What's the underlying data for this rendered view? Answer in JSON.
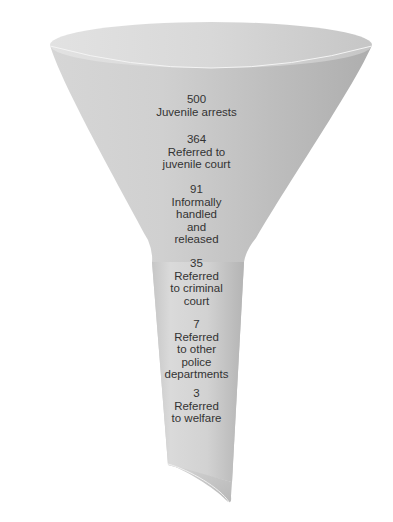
{
  "diagram": {
    "type": "funnel",
    "colors": {
      "background": "#ffffff",
      "funnel_light": "#d4d4d4",
      "funnel_dark": "#b0b0b0",
      "rim_interior": "#dcdcdc",
      "rim_highlight": "#f2f2f2",
      "opening_interior": "#c4c4c4",
      "text": "#333333"
    },
    "stages": [
      {
        "count": "500",
        "lines": [
          "Juvenile arrests"
        ]
      },
      {
        "count": "364",
        "lines": [
          "Referred to",
          "juvenile court"
        ]
      },
      {
        "count": "91",
        "lines": [
          "Informally",
          "handled",
          "and",
          "released"
        ]
      },
      {
        "count": "35",
        "lines": [
          "Referred",
          "to criminal",
          "court"
        ]
      },
      {
        "count": "7",
        "lines": [
          "Referred",
          "to other",
          "police",
          "departments"
        ]
      },
      {
        "count": "3",
        "lines": [
          "Referred",
          "to welfare"
        ]
      }
    ]
  }
}
